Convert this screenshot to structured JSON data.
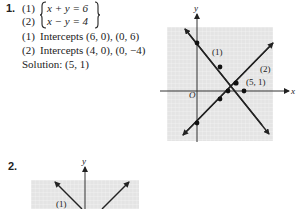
{
  "problem1": {
    "number": "1.",
    "equations": [
      {
        "label": "(1)",
        "expr": "x + y = 6"
      },
      {
        "label": "(2)",
        "expr": "x − y = 4"
      }
    ],
    "intercepts": [
      {
        "label": "(1)",
        "text": "Intercepts (6, 0), (0, 6)"
      },
      {
        "label": "(2)",
        "text": "Intercepts (4, 0), (0, −4)"
      }
    ],
    "solution": "Solution: (5, 1)",
    "graph": {
      "x_axis_label": "x",
      "y_axis_label": "y",
      "origin_label": "O",
      "line_labels": [
        "(1)",
        "(2)"
      ],
      "intersection_label": "(5, 1)",
      "points": {
        "line1": [
          [
            0,
            6
          ],
          [
            3,
            3
          ],
          [
            6,
            0
          ]
        ],
        "line2": [
          [
            0,
            -4
          ],
          [
            3,
            -1
          ],
          [
            4,
            0
          ]
        ],
        "intersection": [
          5,
          1
        ]
      }
    }
  },
  "problem2": {
    "number": "2.",
    "graph": {
      "y_axis_label": "y",
      "line_labels": [
        "(1)"
      ]
    }
  },
  "colors": {
    "grid_bg": "#e6e6e6",
    "grid_line": "#ffffff",
    "ink": "#222222"
  }
}
